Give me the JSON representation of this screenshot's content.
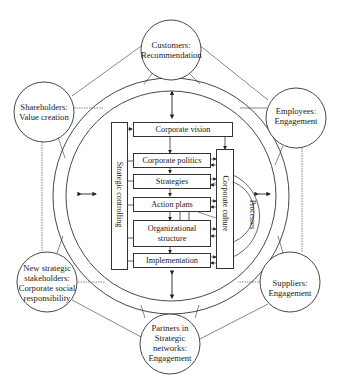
{
  "diagram": {
    "type": "stakeholder-management-model",
    "stakeholders": [
      {
        "id": "customers",
        "title": "Customers:",
        "subtitle": "Recommendation"
      },
      {
        "id": "shareholders",
        "title": "Shareholders:",
        "subtitle": "Value creation"
      },
      {
        "id": "employees",
        "title": "Employees:",
        "subtitle": "Engagement"
      },
      {
        "id": "new-strategic",
        "lines": [
          "New strategic",
          "stakeholders:",
          "Corporate social",
          "responsibility"
        ]
      },
      {
        "id": "suppliers",
        "title": "Suppliers:",
        "subtitle": "Engagement"
      },
      {
        "id": "partners",
        "lines": [
          "Partners in",
          "Strategic",
          "networks:",
          "Engagement"
        ]
      }
    ],
    "core": {
      "vision": "Corporate vision",
      "steps": [
        "Corporate politics",
        "Strategies",
        "Action plans",
        "Organizational structure",
        "Implementation"
      ],
      "organizational_lines": [
        "Organizational",
        "structure"
      ],
      "left_bar": "Strategic controlling",
      "right_bar": "Corporate culture",
      "processes": "Processes"
    }
  }
}
